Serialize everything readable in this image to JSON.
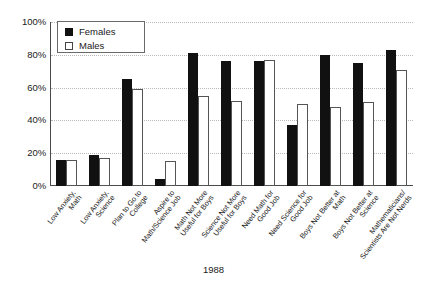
{
  "chart_data": {
    "type": "bar",
    "title": "",
    "xlabel": "1988",
    "ylabel": "",
    "ylim": [
      0,
      100
    ],
    "yticks": [
      "0%",
      "20%",
      "40%",
      "60%",
      "80%",
      "100%"
    ],
    "ytick_values": [
      0,
      20,
      40,
      60,
      80,
      100
    ],
    "grid": true,
    "legend_position": "top-left",
    "categories": [
      "Low Anxiety, Math",
      "Low Anxiety, Science",
      "Plan to Go to College",
      "Aspire to Math/Science Job",
      "Math Not More Useful for Boys",
      "Science Not More Useful for Boys",
      "Need Math for Good Job",
      "Need Science for Good Job",
      "Boys Not Better at Math",
      "Boys Not Better at Science",
      "Mathematicians/Scientists Are Not Nerds"
    ],
    "category_lines": [
      [
        "Low Anxiety,",
        "Math"
      ],
      [
        "Low Anxiety,",
        "Science"
      ],
      [
        "Plan to Go to",
        "College"
      ],
      [
        "Aspire to",
        "Math/Science Job"
      ],
      [
        "Math Not More",
        "Useful for Boys"
      ],
      [
        "Science Not More",
        "Useful for Boys"
      ],
      [
        "Need Math for",
        "Good Job"
      ],
      [
        "Need Science for",
        "Good Job"
      ],
      [
        "Boys Not Better at",
        "Math"
      ],
      [
        "Boys Not Better at",
        "Science"
      ],
      [
        "Mathematicians/",
        "Scientists Are Not Nerds"
      ]
    ],
    "series": [
      {
        "name": "Females",
        "color": "#111111",
        "values": [
          16,
          19,
          65,
          4,
          81,
          76,
          76,
          37,
          80,
          75,
          83
        ]
      },
      {
        "name": "Males",
        "color": "#ffffff",
        "values": [
          16,
          17,
          59,
          15,
          55,
          52,
          77,
          50,
          48,
          51,
          71
        ]
      }
    ]
  },
  "legend": {
    "items": [
      {
        "label": "Females",
        "swatch": "filled-square-icon"
      },
      {
        "label": "Males",
        "swatch": "empty-square-icon"
      }
    ]
  },
  "caption": "1988"
}
